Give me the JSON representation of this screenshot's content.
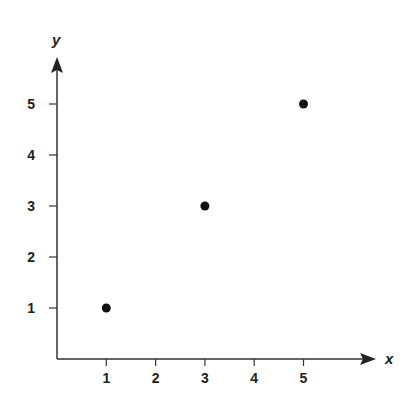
{
  "chart_data": {
    "type": "scatter",
    "title": "",
    "xlabel": "x",
    "ylabel": "y",
    "x": [
      1,
      3,
      5
    ],
    "y": [
      1,
      3,
      5
    ],
    "series": [
      {
        "name": "points",
        "x": [
          1,
          3,
          5
        ],
        "y": [
          1,
          3,
          5
        ],
        "color": "#111111"
      }
    ],
    "xticks": [
      1,
      2,
      3,
      4,
      5
    ],
    "yticks": [
      1,
      2,
      3,
      4,
      5
    ],
    "xlim": [
      0,
      6.5
    ],
    "ylim": [
      0,
      6
    ],
    "grid": false,
    "legend": null
  },
  "axes": {
    "x_label": "x",
    "y_label": "y",
    "x_tick_labels": [
      "1",
      "2",
      "3",
      "4",
      "5"
    ],
    "y_tick_labels": [
      "1",
      "2",
      "3",
      "4",
      "5"
    ]
  }
}
